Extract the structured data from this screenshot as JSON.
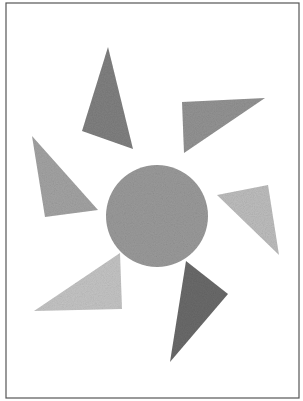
{
  "artwork": {
    "description": "Abstract sun composition: gray textured circle surrounded by six gray triangles inside a thin frame",
    "colors": {
      "background": "#ffffff",
      "frame": "#555555",
      "circle": "#9a9a9a",
      "triangle_dark": "#6e6e6e",
      "triangle_mid": "#8f8f8f",
      "triangle_light": "#b8b8b8"
    },
    "circle": {
      "cx": 157,
      "cy": 216,
      "r": 51
    },
    "triangles": [
      {
        "name": "top-left",
        "points": "108,47 82,131 133,149",
        "fill": "#808080"
      },
      {
        "name": "top-right",
        "points": "182,102 265,98 184,153",
        "fill": "#939393"
      },
      {
        "name": "left",
        "points": "32,136 45,217 98,210",
        "fill": "#a3a3a3"
      },
      {
        "name": "right",
        "points": "217,195 268,185 279,255",
        "fill": "#bdbdbd"
      },
      {
        "name": "bottom-left",
        "points": "34,311 120,253 122,309",
        "fill": "#c4c4c4"
      },
      {
        "name": "bottom-right",
        "points": "186,261 228,294 170,362",
        "fill": "#6a6a6a"
      }
    ]
  }
}
